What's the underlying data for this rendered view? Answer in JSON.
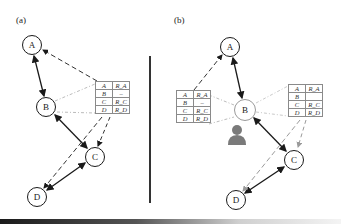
{
  "figure": {
    "panels": [
      {
        "id": "a",
        "label": "(a)",
        "nodes": [
          {
            "id": "A",
            "label": "A"
          },
          {
            "id": "B",
            "label": "B"
          },
          {
            "id": "C",
            "label": "C"
          },
          {
            "id": "D",
            "label": "D"
          }
        ],
        "routing_table": {
          "owner": "B",
          "rows": [
            {
              "dest": "A",
              "route": "R_A"
            },
            {
              "dest": "B",
              "route": "–"
            },
            {
              "dest": "C",
              "route": "R_C"
            },
            {
              "dest": "D",
              "route": "R_D"
            }
          ]
        }
      },
      {
        "id": "b",
        "label": "(b)",
        "nodes": [
          {
            "id": "A",
            "label": "A"
          },
          {
            "id": "B",
            "label": "B",
            "state": "compromised"
          },
          {
            "id": "C",
            "label": "C"
          },
          {
            "id": "D",
            "label": "D"
          }
        ],
        "routing_table_left": {
          "rows": [
            {
              "dest": "A",
              "route": "R_A"
            },
            {
              "dest": "B",
              "route": "–"
            },
            {
              "dest": "C",
              "route": "R_C"
            },
            {
              "dest": "D",
              "route": "R_D"
            }
          ]
        },
        "routing_table_right": {
          "rows": [
            {
              "dest": "A",
              "route": "R_A"
            },
            {
              "dest": "B",
              "route": ""
            },
            {
              "dest": "C",
              "route": "R_C"
            },
            {
              "dest": "D",
              "route": "R_D"
            }
          ]
        },
        "attacker_icon": "person-icon"
      }
    ],
    "colors": {
      "edge_solid": "#1a1a1a",
      "edge_dashed": "#333333",
      "edge_dashed_gray": "#9a9a9a",
      "table_border": "#8a8a8a",
      "attacker": "#7a7a7a"
    }
  }
}
